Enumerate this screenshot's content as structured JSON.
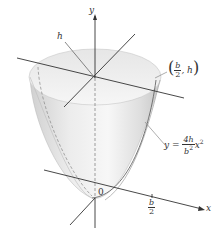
{
  "figure": {
    "labels": {
      "y_axis": "y",
      "x_axis": "x",
      "origin": "0",
      "height": "h",
      "point_open": "(",
      "point_b": "b",
      "point_2": "2",
      "point_comma_h": ", h",
      "point_close": ")",
      "equation_lhs": "y =",
      "equation_num": "4h",
      "equation_den": "b",
      "equation_den_exp": "2",
      "equation_var": "x",
      "equation_exp": "2",
      "tick_num": "b",
      "tick_den": "2"
    },
    "colors": {
      "surface_light": "#f2f2f2",
      "surface_mid": "#dcdcdc",
      "surface_dark": "#c4c4c4",
      "axis": "#333333"
    }
  }
}
